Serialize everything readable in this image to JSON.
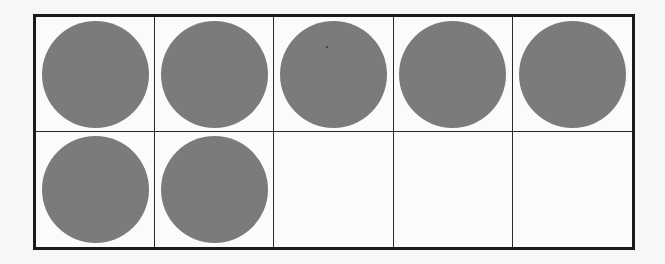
{
  "diagram": {
    "type": "ten-frame",
    "rows": 2,
    "columns": 5,
    "total_cells": 10,
    "filled_count": 7,
    "empty_count": 3,
    "colors": {
      "counter": "#7b7b7b",
      "grid_line": "#1a1a1a",
      "background": "#fbfbfb"
    },
    "cells": [
      {
        "row": 1,
        "col": 1,
        "filled": true
      },
      {
        "row": 1,
        "col": 2,
        "filled": true
      },
      {
        "row": 1,
        "col": 3,
        "filled": true
      },
      {
        "row": 1,
        "col": 4,
        "filled": true
      },
      {
        "row": 1,
        "col": 5,
        "filled": true
      },
      {
        "row": 2,
        "col": 1,
        "filled": true
      },
      {
        "row": 2,
        "col": 2,
        "filled": true
      },
      {
        "row": 2,
        "col": 3,
        "filled": false
      },
      {
        "row": 2,
        "col": 4,
        "filled": false
      },
      {
        "row": 2,
        "col": 5,
        "filled": false
      }
    ]
  }
}
